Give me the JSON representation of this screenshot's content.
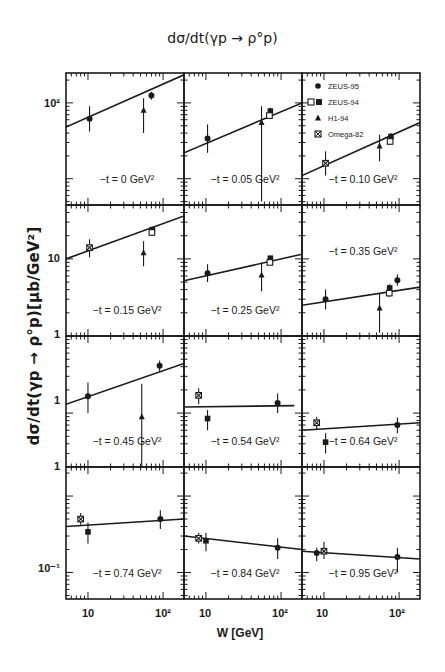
{
  "chart_data": {
    "type": "scatter",
    "title": "dσ/dt(γp → ρ°p)",
    "xlabel": "W [GeV]",
    "ylabel": "dσ/dt(γp → ρ°p)[μb/GeV²]",
    "xscale": "log",
    "yscale": "log",
    "xlim": [
      5.1,
      190
    ],
    "x_tick_labels": [
      "10",
      "10²"
    ],
    "y_tick_labels": [
      "10²",
      "10",
      "1",
      "1",
      "1",
      "10⁻¹"
    ],
    "legend": {
      "position": "top-right panel (upper-left corner)",
      "entries": [
        {
          "marker": "filled-circle",
          "label": "ZEUS-95"
        },
        {
          "marker": "open-square / filled-square",
          "label": "ZEUS-94"
        },
        {
          "marker": "filled-triangle",
          "label": "H1-94"
        },
        {
          "marker": "starred-square",
          "label": "Omega-82"
        }
      ]
    },
    "layout": {
      "rows": 4,
      "cols": 3,
      "grid": false
    },
    "panels": [
      {
        "label": "−t = 0 GeV²",
        "row": 0,
        "col": 0,
        "ylim": [
          4.5,
          248
        ],
        "fit": [
          [
            5.1,
            48
          ],
          [
            190,
            235
          ]
        ],
        "points": [
          {
            "series": "Omega-82",
            "marker": "filled-circle",
            "W": 10.5,
            "y": 62,
            "err": [
              42,
              90
            ]
          },
          {
            "series": "H1-94",
            "marker": "filled-triangle",
            "W": 55,
            "y": 80,
            "err": [
              40,
              115
            ]
          },
          {
            "series": "ZEUS-95",
            "marker": "filled-circle",
            "W": 70,
            "y": 125,
            "err": [
              110,
              140
            ]
          }
        ]
      },
      {
        "label": "−t = 0.05 GeV²",
        "row": 0,
        "col": 1,
        "ylim": [
          4.5,
          248
        ],
        "fit": [
          [
            5.1,
            22
          ],
          [
            190,
            100
          ]
        ],
        "points": [
          {
            "series": "Omega-82",
            "marker": "filled-circle",
            "W": 10.5,
            "y": 34,
            "err": [
              22,
              52
            ]
          },
          {
            "series": "H1-94",
            "marker": "filled-triangle",
            "W": 55,
            "y": 55,
            "err": [
              5,
              90
            ]
          },
          {
            "series": "ZEUS-94",
            "marker": "filled-square",
            "W": 72,
            "y": 78,
            "err": [
              70,
              86
            ]
          },
          {
            "series": "ZEUS-94",
            "marker": "open-square",
            "W": 70,
            "y": 68,
            "err": [
              62,
              75
            ]
          }
        ]
      },
      {
        "label": "−t = 0.10 GeV²",
        "row": 0,
        "col": 2,
        "ylim": [
          4.5,
          248
        ],
        "fit": [
          [
            5.1,
            11
          ],
          [
            190,
            55
          ]
        ],
        "points": [
          {
            "series": "Omega-82",
            "marker": "starred-square",
            "W": 10.5,
            "y": 16,
            "err": [
              11,
              23
            ]
          },
          {
            "series": "H1-94",
            "marker": "filled-triangle",
            "W": 55,
            "y": 27,
            "err": [
              17,
              38
            ]
          },
          {
            "series": "ZEUS-94",
            "marker": "filled-square",
            "W": 78,
            "y": 36,
            "err": [
              33,
              40
            ]
          },
          {
            "series": "ZEUS-94",
            "marker": "open-square",
            "W": 76,
            "y": 31,
            "err": [
              28,
              34
            ]
          }
        ]
      },
      {
        "label": "−t = 0.15 GeV²",
        "row": 1,
        "col": 0,
        "ylim": [
          1,
          50
        ],
        "fit": [
          [
            5.1,
            10
          ],
          [
            190,
            36
          ]
        ],
        "points": [
          {
            "series": "Omega-82",
            "marker": "starred-square",
            "W": 10.5,
            "y": 14,
            "err": [
              10.5,
              18
            ]
          },
          {
            "series": "H1-94",
            "marker": "filled-triangle",
            "W": 55,
            "y": 12,
            "err": [
              8,
              17
            ]
          },
          {
            "series": "ZEUS-94",
            "marker": "filled-square",
            "W": 72,
            "y": 24,
            "err": [
              22,
              26
            ]
          },
          {
            "series": "ZEUS-94",
            "marker": "open-square",
            "W": 71,
            "y": 22,
            "err": [
              20,
              24
            ]
          }
        ]
      },
      {
        "label": "−t = 0.25 GeV²",
        "row": 1,
        "col": 1,
        "ylim": [
          1,
          50
        ],
        "fit": [
          [
            5.1,
            5.2
          ],
          [
            190,
            11.5
          ]
        ],
        "points": [
          {
            "series": "Omega-82",
            "marker": "filled-circle",
            "W": 10.5,
            "y": 6.5,
            "err": [
              5,
              8.5
            ]
          },
          {
            "series": "H1-94",
            "marker": "filled-triangle",
            "W": 55,
            "y": 6.2,
            "err": [
              3.8,
              9
            ]
          },
          {
            "series": "ZEUS-94",
            "marker": "filled-square",
            "W": 72,
            "y": 10.2,
            "err": [
              9.5,
              11
            ]
          },
          {
            "series": "ZEUS-94",
            "marker": "open-square",
            "W": 71,
            "y": 9,
            "err": [
              8.4,
              9.6
            ]
          }
        ]
      },
      {
        "label": "−t = 0.35 GeV²",
        "row": 1,
        "col": 2,
        "ylim": [
          1,
          50
        ],
        "fit": [
          [
            5.1,
            2.5
          ],
          [
            190,
            4.3
          ]
        ],
        "points": [
          {
            "series": "Omega-82",
            "marker": "filled-circle",
            "W": 10.5,
            "y": 3,
            "err": [
              2.2,
              4
            ]
          },
          {
            "series": "H1-94",
            "marker": "filled-triangle",
            "W": 55,
            "y": 2.3,
            "err": [
              1.1,
              3.5
            ]
          },
          {
            "series": "ZEUS-94",
            "marker": "filled-square",
            "W": 75,
            "y": 4.2,
            "err": [
              3.8,
              4.7
            ]
          },
          {
            "series": "ZEUS-94",
            "marker": "open-square",
            "W": 74,
            "y": 3.6,
            "err": [
              3.2,
              4
            ]
          },
          {
            "series": "ZEUS-95",
            "marker": "filled-circle",
            "W": 95,
            "y": 5.3,
            "err": [
              4.5,
              6.3
            ]
          }
        ]
      },
      {
        "label": "−t = 0.45 GeV²",
        "row": 2,
        "col": 0,
        "ylim": [
          0.2,
          10
        ],
        "fit": [
          [
            5.1,
            1.3
          ],
          [
            190,
            4.4
          ]
        ],
        "points": [
          {
            "series": "Omega-82",
            "marker": "filled-circle",
            "W": 10,
            "y": 1.65,
            "err": [
              1,
              2.5
            ]
          },
          {
            "series": "H1-94",
            "marker": "filled-triangle",
            "W": 52,
            "y": 0.9,
            "err": [
              0.2,
              2.4
            ]
          },
          {
            "series": "ZEUS-95",
            "marker": "filled-circle",
            "W": 90,
            "y": 4.1,
            "err": [
              3.4,
              4.8
            ]
          }
        ]
      },
      {
        "label": "−t = 0.54 GeV²",
        "row": 2,
        "col": 1,
        "ylim": [
          0.2,
          10
        ],
        "fit": [
          [
            5.1,
            1.2
          ],
          [
            150,
            1.25
          ]
        ],
        "points": [
          {
            "series": "Omega-82",
            "marker": "starred-square",
            "W": 8,
            "y": 1.7,
            "err": [
              1.3,
              2.1
            ]
          },
          {
            "series": "Omega-82",
            "marker": "filled-square",
            "W": 10.5,
            "y": 0.85,
            "err": [
              0.6,
              1.1
            ]
          },
          {
            "series": "ZEUS-95",
            "marker": "filled-circle",
            "W": 90,
            "y": 1.35,
            "err": [
              1,
              1.8
            ]
          }
        ]
      },
      {
        "label": "−t = 0.64 GeV²",
        "row": 2,
        "col": 2,
        "ylim": [
          0.2,
          10
        ],
        "fit": [
          [
            5.1,
            0.6
          ],
          [
            190,
            0.75
          ]
        ],
        "points": [
          {
            "series": "Omega-82",
            "marker": "starred-square",
            "W": 8,
            "y": 0.75,
            "err": [
              0.6,
              0.9
            ]
          },
          {
            "series": "Omega-82",
            "marker": "filled-square",
            "W": 10.5,
            "y": 0.42,
            "err": [
              0.3,
              0.55
            ]
          },
          {
            "series": "ZEUS-95",
            "marker": "filled-circle",
            "W": 95,
            "y": 0.7,
            "err": [
              0.55,
              0.88
            ]
          }
        ]
      },
      {
        "label": "−t = 0.74 GeV²",
        "row": 3,
        "col": 0,
        "ylim": [
          0.045,
          2.4
        ],
        "fit": [
          [
            5.1,
            0.4
          ],
          [
            190,
            0.5
          ]
        ],
        "points": [
          {
            "series": "Omega-82",
            "marker": "starred-square",
            "W": 8,
            "y": 0.5,
            "err": [
              0.42,
              0.6
            ]
          },
          {
            "series": "Omega-82",
            "marker": "filled-square",
            "W": 10,
            "y": 0.34,
            "err": [
              0.24,
              0.45
            ]
          },
          {
            "series": "ZEUS-95",
            "marker": "filled-circle",
            "W": 92,
            "y": 0.5,
            "err": [
              0.37,
              0.65
            ]
          }
        ]
      },
      {
        "label": "−t = 0.84 GeV²",
        "row": 3,
        "col": 1,
        "ylim": [
          0.045,
          2.4
        ],
        "fit": [
          [
            5.1,
            0.3
          ],
          [
            190,
            0.2
          ]
        ],
        "points": [
          {
            "series": "Omega-82",
            "marker": "starred-square",
            "W": 8,
            "y": 0.28,
            "err": [
              0.24,
              0.33
            ]
          },
          {
            "series": "Omega-82",
            "marker": "filled-square",
            "W": 10,
            "y": 0.26,
            "err": [
              0.19,
              0.33
            ]
          },
          {
            "series": "ZEUS-95",
            "marker": "filled-circle",
            "W": 90,
            "y": 0.21,
            "err": [
              0.15,
              0.28
            ]
          }
        ]
      },
      {
        "label": "−t = 0.95 GeV²",
        "row": 3,
        "col": 2,
        "ylim": [
          0.045,
          2.4
        ],
        "fit": [
          [
            5.1,
            0.19
          ],
          [
            190,
            0.15
          ]
        ],
        "points": [
          {
            "series": "Omega-82",
            "marker": "filled-circle",
            "W": 8,
            "y": 0.18,
            "err": [
              0.14,
              0.21
            ]
          },
          {
            "series": "Omega-82",
            "marker": "starred-square",
            "W": 10,
            "y": 0.19,
            "err": [
              0.15,
              0.25
            ]
          },
          {
            "series": "ZEUS-95",
            "marker": "filled-circle",
            "W": 95,
            "y": 0.16,
            "err": [
              0.1,
              0.21
            ]
          }
        ]
      }
    ]
  },
  "figure": {
    "title": "dσ/dt(γp → ρ°p)",
    "ylabel": "dσ/dt(γp → ρ°p)[μb/GeV²]",
    "xlabel": "W [GeV]",
    "x_ticks": [
      {
        "text": "10",
        "x": 88
      },
      {
        "text": "10²",
        "x": 163
      },
      {
        "text": "10",
        "x": 205
      },
      {
        "text": "10²",
        "x": 280
      },
      {
        "text": "10",
        "x": 322
      },
      {
        "text": "10²",
        "x": 397
      }
    ],
    "y_ticks": [
      {
        "text": "10²",
        "y": 103
      },
      {
        "text": "10",
        "y": 258
      },
      {
        "text": "1",
        "y": 334
      },
      {
        "text": "1",
        "y": 400
      },
      {
        "text": "1",
        "y": 466
      },
      {
        "text": "10⁻¹",
        "y": 568
      }
    ],
    "colors": {
      "ink": "#1a1a1a",
      "background": "#ffffff"
    }
  }
}
